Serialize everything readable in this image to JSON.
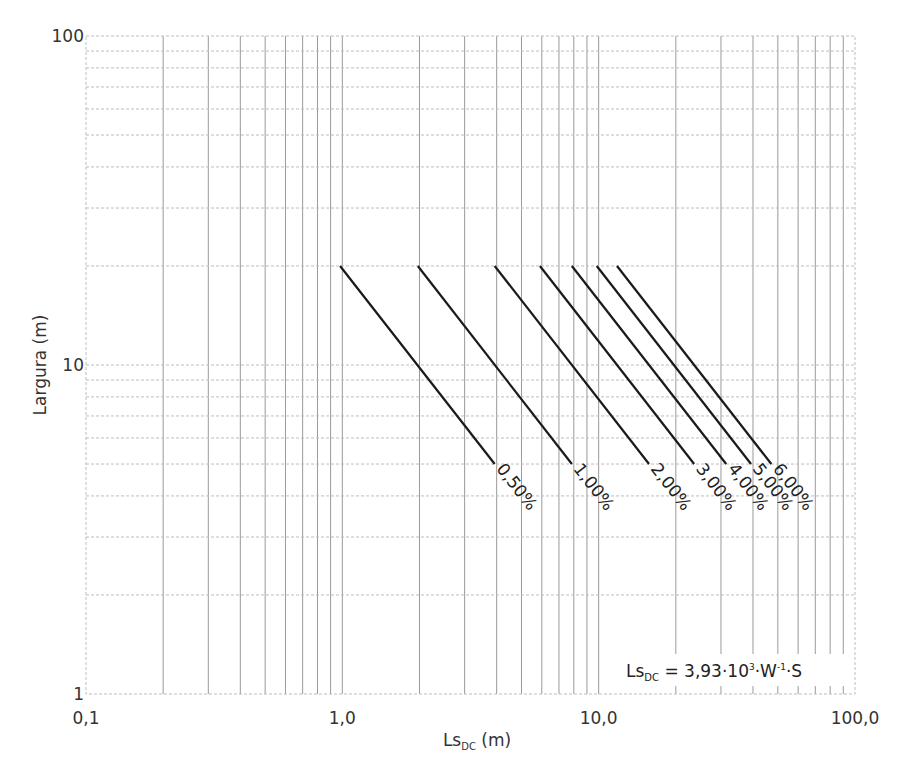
{
  "chart_data": {
    "type": "line",
    "title": "",
    "xlabel": "Ls",
    "xlabel_sub": "DC",
    "xlabel_unit": " (m)",
    "ylabel": "Largura (m)",
    "xscale": "log",
    "yscale": "log",
    "xlim": [
      0.1,
      100
    ],
    "ylim": [
      1,
      100
    ],
    "grid": true,
    "x_ticks": [
      {
        "value": 0.1,
        "label": "0,1"
      },
      {
        "value": 1,
        "label": "1,0"
      },
      {
        "value": 10,
        "label": "10,0"
      },
      {
        "value": 100,
        "label": "100,0"
      }
    ],
    "y_ticks": [
      {
        "value": 1,
        "label": "1"
      },
      {
        "value": 10,
        "label": "10"
      },
      {
        "value": 100,
        "label": "100"
      }
    ],
    "series": [
      {
        "name": "0,50%",
        "slope": 0.005,
        "points": [
          {
            "x": 0.98,
            "y": 20
          },
          {
            "x": 3.93,
            "y": 5
          }
        ]
      },
      {
        "name": "1,00%",
        "slope": 0.01,
        "points": [
          {
            "x": 1.97,
            "y": 20
          },
          {
            "x": 7.86,
            "y": 5
          }
        ]
      },
      {
        "name": "2,00%",
        "slope": 0.02,
        "points": [
          {
            "x": 3.93,
            "y": 20
          },
          {
            "x": 15.72,
            "y": 5
          }
        ]
      },
      {
        "name": "3,00%",
        "slope": 0.03,
        "points": [
          {
            "x": 5.9,
            "y": 20
          },
          {
            "x": 23.58,
            "y": 5
          }
        ]
      },
      {
        "name": "4,00%",
        "slope": 0.04,
        "points": [
          {
            "x": 7.86,
            "y": 20
          },
          {
            "x": 31.44,
            "y": 5
          }
        ]
      },
      {
        "name": "5,00%",
        "slope": 0.05,
        "points": [
          {
            "x": 9.83,
            "y": 20
          },
          {
            "x": 39.3,
            "y": 5
          }
        ]
      },
      {
        "name": "6,00%",
        "slope": 0.06,
        "points": [
          {
            "x": 11.79,
            "y": 20
          },
          {
            "x": 47.16,
            "y": 5
          }
        ]
      }
    ],
    "annotation": {
      "lhs": "Ls",
      "lhs_sub": "DC",
      "text_a": " = 3,93·10",
      "sup_a": "3",
      "text_b": "·W",
      "sup_b": "-1",
      "text_c": "·S"
    },
    "colors": {
      "series": "#1a1a1a",
      "grid_major": "#9a9a9a",
      "grid_minor_h": "#bdbdbd",
      "text": "#333333"
    }
  }
}
